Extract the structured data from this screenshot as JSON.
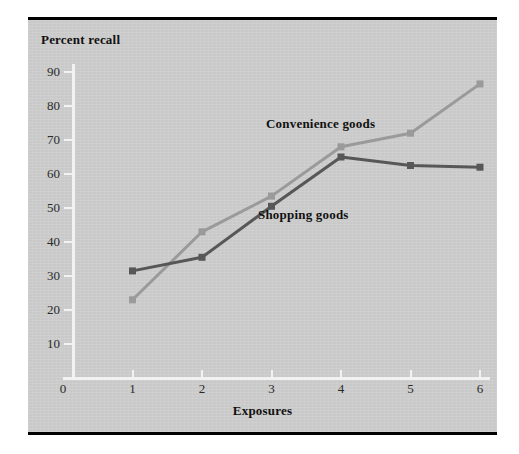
{
  "figure": {
    "panel_color": "#c9c9c9",
    "axis_color": "#f2f2f2",
    "rule_color": "#000000"
  },
  "chart_data": {
    "type": "line",
    "title": "",
    "subtitle": "",
    "xlabel": "Exposures",
    "ylabel": "Percent recall",
    "x": [
      1,
      2,
      3,
      4,
      5,
      6
    ],
    "xtick_labels": [
      "0",
      "1",
      "2",
      "3",
      "4",
      "5",
      "6"
    ],
    "xtick_values": [
      0,
      1,
      2,
      3,
      4,
      5,
      6
    ],
    "ytick_labels": [
      "10",
      "20",
      "30",
      "40",
      "50",
      "60",
      "70",
      "80",
      "90"
    ],
    "ytick_values": [
      10,
      20,
      30,
      40,
      50,
      60,
      70,
      80,
      90
    ],
    "xlim": [
      0,
      6
    ],
    "ylim": [
      0,
      92
    ],
    "grid": false,
    "legend_position": "inline-annotations",
    "series": [
      {
        "name": "Convenience goods",
        "color": "#9a9a9a",
        "marker": "square",
        "values": [
          23,
          43,
          53.5,
          68,
          72,
          86.5
        ],
        "label_text": "Convenience goods"
      },
      {
        "name": "Shopping goods",
        "color": "#575757",
        "marker": "square",
        "values": [
          31.5,
          35.5,
          50.5,
          65,
          62.5,
          62
        ],
        "label_text": "Shopping goods"
      }
    ],
    "annotations": [
      {
        "text": "Convenience goods",
        "x": 3.5,
        "y": 76
      },
      {
        "text": "Shopping goods",
        "x": 3.4,
        "y": 49
      }
    ]
  }
}
